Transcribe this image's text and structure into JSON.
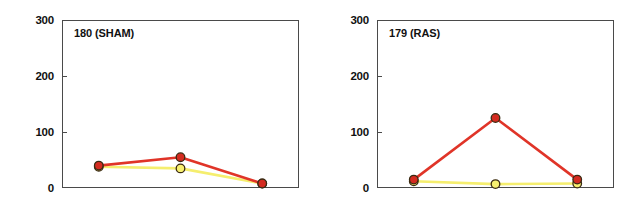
{
  "figure": {
    "background_color": "#ffffff",
    "panel_count": 2
  },
  "chart_data": [
    {
      "type": "line",
      "title": "180 (SHAM)",
      "xlabel": "",
      "ylabel": "",
      "x": [
        1,
        2,
        3
      ],
      "categories": [
        "1",
        "2",
        "3"
      ],
      "xlim": [
        0.55,
        3.45
      ],
      "ylim": [
        0,
        300
      ],
      "yticks": [
        0,
        100,
        200,
        300
      ],
      "ytick_labels": [
        "0",
        "100",
        "200",
        "300"
      ],
      "xticks": [],
      "xtick_labels": [],
      "grid": false,
      "legend": "none",
      "series": [
        {
          "name": "red",
          "color": "#e03428",
          "marker": "circle",
          "marker_face_color": "#d42b20",
          "marker_edge_color": "#3a2a12",
          "values": [
            40,
            55,
            8
          ]
        },
        {
          "name": "yellow",
          "color": "#f5ee6e",
          "marker": "circle",
          "marker_face_color": "#f7f070",
          "marker_edge_color": "#3a2a12",
          "values": [
            38,
            35,
            8
          ]
        }
      ]
    },
    {
      "type": "line",
      "title": "179 (RAS)",
      "xlabel": "",
      "ylabel": "",
      "x": [
        1,
        2,
        3
      ],
      "categories": [
        "1",
        "2",
        "3"
      ],
      "xlim": [
        0.55,
        3.45
      ],
      "ylim": [
        0,
        300
      ],
      "yticks": [
        0,
        100,
        200,
        300
      ],
      "ytick_labels": [
        "0",
        "100",
        "200",
        "300"
      ],
      "xticks": [],
      "xtick_labels": [],
      "grid": false,
      "legend": "none",
      "series": [
        {
          "name": "red",
          "color": "#e03428",
          "marker": "circle",
          "marker_face_color": "#d42b20",
          "marker_edge_color": "#3a2a12",
          "values": [
            15,
            125,
            15
          ]
        },
        {
          "name": "yellow",
          "color": "#f5ee6e",
          "marker": "circle",
          "marker_face_color": "#f7f070",
          "marker_edge_color": "#3a2a12",
          "values": [
            12,
            7,
            8
          ]
        }
      ]
    }
  ]
}
